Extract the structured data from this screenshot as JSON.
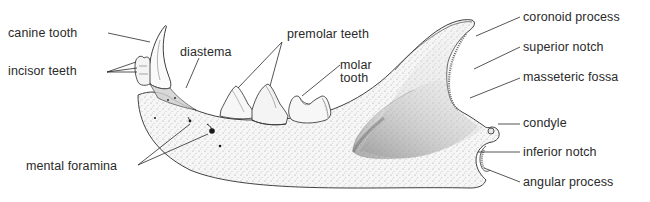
{
  "diagram": {
    "colors": {
      "ink": "#2a2a2a",
      "bone": "#f4f4f4",
      "stipple": "#9a9a9a",
      "fossa_shade": "#7a7a7a",
      "background": "#ffffff"
    },
    "labels": {
      "canine_tooth": "canine tooth",
      "incisor_teeth": "incisor teeth",
      "diastema": "diastema",
      "premolar_teeth": "premolar teeth",
      "molar_line1": "molar",
      "molar_line2": "tooth",
      "mental_foramina": "mental foramina",
      "coronoid_process": "coronoid process",
      "superior_notch": "superior notch",
      "masseteric_fossa": "masseteric fossa",
      "condyle": "condyle",
      "inferior_notch": "inferior notch",
      "angular_process": "angular process"
    }
  }
}
